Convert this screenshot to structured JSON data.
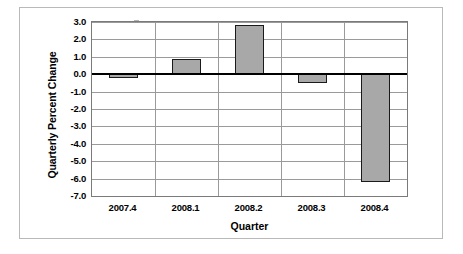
{
  "chart_data": {
    "type": "bar",
    "title": "",
    "categories": [
      "2007.4",
      "2008.1",
      "2008.2",
      "2008.3",
      "2008.4"
    ],
    "values": [
      -0.2,
      0.9,
      2.8,
      -0.5,
      -6.2
    ],
    "xlabel": "Quarter",
    "ylabel": "Quarterly Percent Change",
    "ylim": [
      -7.0,
      3.0
    ],
    "ytick_step": 1.0,
    "yticks": [
      3.0,
      2.0,
      1.0,
      0.0,
      -1.0,
      -2.0,
      -3.0,
      -4.0,
      -5.0,
      -6.0,
      -7.0
    ],
    "ytick_labels": [
      "3.0",
      "2.0",
      "1.0",
      "0.0",
      "-1.0",
      "-2.0",
      "-3.0",
      "-4.0",
      "-5.0",
      "-6.0",
      "-7.0"
    ],
    "grid": true,
    "legend": false,
    "legend_position": "none",
    "bar_color": "#a8a8a8",
    "bar_edge_color": "#1a1a1a",
    "gridline_color": "#9a9a9a",
    "zero_line_color": "#000000",
    "plot_border_color": "#7a7a7a",
    "frame_color": "#b9b9b9",
    "background_color": "#ffffff"
  }
}
